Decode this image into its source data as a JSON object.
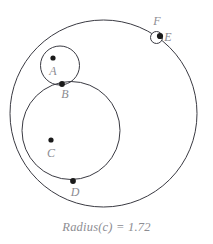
{
  "figure": {
    "type": "geometry-diagram",
    "background_color": "#ffffff",
    "stroke_color": "#3a3a42",
    "label_color": "#8c8c92",
    "point_color": "#1a1a1a",
    "circles": [
      {
        "name": "large-circle",
        "id": "outer",
        "cx": 103.5,
        "cy": 113.5,
        "r": 93.5
      },
      {
        "name": "medium-circle",
        "id": "c",
        "cx": 71,
        "cy": 130.5,
        "r": 49
      },
      {
        "name": "small-circle",
        "id": "a",
        "cx": 60,
        "cy": 65.5,
        "r": 19.5
      },
      {
        "name": "tiny-circle",
        "id": "f",
        "cx": 156.5,
        "cy": 37.5,
        "r": 6
      }
    ],
    "points": [
      {
        "label": "A",
        "cx": 53,
        "cy": 58,
        "label_x": 53,
        "label_y": 75
      },
      {
        "label": "B",
        "cx": 62,
        "cy": 84,
        "label_x": 65,
        "label_y": 98
      },
      {
        "label": "C",
        "cx": 51,
        "cy": 140,
        "label_x": 51,
        "label_y": 157
      },
      {
        "label": "D",
        "cx": 73,
        "cy": 181,
        "label_x": 75,
        "label_y": 196
      },
      {
        "label": "E",
        "cx": 160,
        "cy": 36,
        "label_x": 168,
        "label_y": 41
      },
      {
        "label": "F",
        "cx": null,
        "cy": null,
        "label_x": 157,
        "label_y": 25
      }
    ]
  },
  "caption": {
    "text": "Radius(c) = 1.72",
    "measure_label": "Radius",
    "measure_object": "c",
    "measure_value": "1.72"
  }
}
